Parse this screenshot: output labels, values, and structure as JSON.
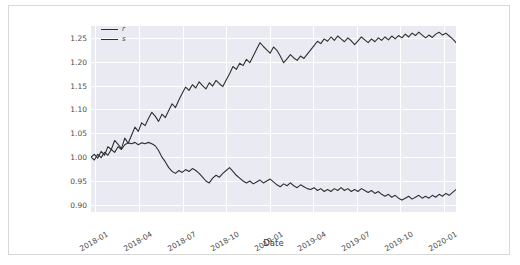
{
  "figure": {
    "background_color": "#ffffff",
    "border_color": "#d8d8d8",
    "plot_background_color": "#eaeaf2",
    "grid_color": "#ffffff",
    "line_color": "#303030"
  },
  "axes": {
    "xlabel": "Date",
    "ylabel": "",
    "ytick_labels": [
      "0.90",
      "0.95",
      "1.00",
      "1.05",
      "1.10",
      "1.15",
      "1.20",
      "1.25"
    ],
    "xtick_labels": [
      "2018-01",
      "2018-04",
      "2018-07",
      "2018-10",
      "2019-01",
      "2019-04",
      "2019-07",
      "2019-10",
      "2020-01"
    ]
  },
  "legend": {
    "entries": [
      {
        "label": "r",
        "color": "#303030"
      },
      {
        "label": "s",
        "color": "#303030"
      }
    ]
  },
  "chart_data": {
    "type": "line",
    "title": "",
    "xlabel": "Date",
    "ylabel": "",
    "grid": true,
    "legend_position": "upper left",
    "xlim": [
      "2018-01-01",
      "2020-02-01"
    ],
    "ylim": [
      0.885,
      1.275
    ],
    "ytick_values": [
      0.9,
      0.95,
      1.0,
      1.05,
      1.1,
      1.15,
      1.2,
      1.25
    ],
    "xtick_values": [
      "2018-01",
      "2018-04",
      "2018-07",
      "2018-10",
      "2019-01",
      "2019-04",
      "2019-07",
      "2019-10",
      "2020-01"
    ],
    "x": [
      "2018-01-02",
      "2018-01-09",
      "2018-01-16",
      "2018-01-23",
      "2018-01-30",
      "2018-02-06",
      "2018-02-13",
      "2018-02-20",
      "2018-02-27",
      "2018-03-06",
      "2018-03-13",
      "2018-03-20",
      "2018-03-27",
      "2018-04-03",
      "2018-04-10",
      "2018-04-17",
      "2018-04-24",
      "2018-05-01",
      "2018-05-08",
      "2018-05-15",
      "2018-05-22",
      "2018-05-29",
      "2018-06-05",
      "2018-06-12",
      "2018-06-19",
      "2018-06-26",
      "2018-07-03",
      "2018-07-10",
      "2018-07-17",
      "2018-07-24",
      "2018-07-31",
      "2018-08-07",
      "2018-08-14",
      "2018-08-21",
      "2018-08-28",
      "2018-09-04",
      "2018-09-11",
      "2018-09-18",
      "2018-09-25",
      "2018-10-02",
      "2018-10-09",
      "2018-10-16",
      "2018-10-23",
      "2018-10-30",
      "2018-11-06",
      "2018-11-13",
      "2018-11-20",
      "2018-11-27",
      "2018-12-04",
      "2018-12-11",
      "2018-12-18",
      "2018-12-25",
      "2019-01-01",
      "2019-01-08",
      "2019-01-15",
      "2019-01-22",
      "2019-01-29",
      "2019-02-05",
      "2019-02-12",
      "2019-02-19",
      "2019-02-26",
      "2019-03-05",
      "2019-03-12",
      "2019-03-19",
      "2019-03-26",
      "2019-04-02",
      "2019-04-09",
      "2019-04-16",
      "2019-04-23",
      "2019-04-30",
      "2019-05-07",
      "2019-05-14",
      "2019-05-21",
      "2019-05-28",
      "2019-06-04",
      "2019-06-11",
      "2019-06-18",
      "2019-06-25",
      "2019-07-02",
      "2019-07-09",
      "2019-07-16",
      "2019-07-23",
      "2019-07-30",
      "2019-08-06",
      "2019-08-13",
      "2019-08-20",
      "2019-08-27",
      "2019-09-03",
      "2019-09-10",
      "2019-09-17",
      "2019-09-24",
      "2019-10-01",
      "2019-10-08",
      "2019-10-15",
      "2019-10-22",
      "2019-10-29",
      "2019-11-05",
      "2019-11-12",
      "2019-11-19",
      "2019-11-26",
      "2019-12-03",
      "2019-12-10",
      "2019-12-17",
      "2019-12-24",
      "2019-12-31",
      "2020-01-07",
      "2020-01-14",
      "2020-01-21",
      "2020-01-28"
    ],
    "series": [
      {
        "name": "r",
        "color": "#303030",
        "values": [
          1.0,
          1.006,
          0.998,
          1.012,
          1.004,
          1.022,
          1.016,
          1.035,
          1.027,
          1.018,
          1.04,
          1.029,
          1.046,
          1.063,
          1.054,
          1.072,
          1.066,
          1.081,
          1.094,
          1.086,
          1.075,
          1.09,
          1.083,
          1.098,
          1.112,
          1.104,
          1.12,
          1.134,
          1.147,
          1.14,
          1.152,
          1.145,
          1.158,
          1.15,
          1.143,
          1.156,
          1.149,
          1.161,
          1.154,
          1.148,
          1.162,
          1.175,
          1.19,
          1.184,
          1.197,
          1.192,
          1.205,
          1.198,
          1.212,
          1.226,
          1.24,
          1.232,
          1.225,
          1.218,
          1.231,
          1.224,
          1.212,
          1.198,
          1.206,
          1.215,
          1.208,
          1.203,
          1.212,
          1.207,
          1.216,
          1.225,
          1.234,
          1.243,
          1.238,
          1.248,
          1.243,
          1.252,
          1.245,
          1.254,
          1.248,
          1.242,
          1.25,
          1.244,
          1.236,
          1.244,
          1.252,
          1.246,
          1.24,
          1.248,
          1.242,
          1.25,
          1.245,
          1.252,
          1.246,
          1.254,
          1.248,
          1.255,
          1.25,
          1.258,
          1.252,
          1.26,
          1.255,
          1.262,
          1.256,
          1.25,
          1.256,
          1.251,
          1.258,
          1.262,
          1.256,
          1.26,
          1.254,
          1.248,
          1.24
        ]
      },
      {
        "name": "s",
        "color": "#303030",
        "values": [
          1.0,
          0.994,
          1.006,
          0.999,
          1.01,
          1.004,
          1.016,
          1.01,
          1.022,
          1.016,
          1.026,
          1.03,
          1.028,
          1.031,
          1.026,
          1.03,
          1.028,
          1.031,
          1.028,
          1.024,
          1.014,
          1.0,
          0.99,
          0.978,
          0.97,
          0.966,
          0.972,
          0.968,
          0.974,
          0.97,
          0.976,
          0.972,
          0.966,
          0.958,
          0.95,
          0.946,
          0.956,
          0.962,
          0.958,
          0.966,
          0.972,
          0.978,
          0.97,
          0.962,
          0.956,
          0.95,
          0.946,
          0.95,
          0.944,
          0.948,
          0.952,
          0.946,
          0.95,
          0.954,
          0.948,
          0.942,
          0.938,
          0.944,
          0.94,
          0.946,
          0.94,
          0.936,
          0.942,
          0.938,
          0.934,
          0.932,
          0.936,
          0.93,
          0.934,
          0.928,
          0.932,
          0.928,
          0.934,
          0.93,
          0.936,
          0.93,
          0.934,
          0.928,
          0.932,
          0.928,
          0.934,
          0.93,
          0.926,
          0.93,
          0.924,
          0.928,
          0.922,
          0.918,
          0.922,
          0.916,
          0.92,
          0.914,
          0.91,
          0.914,
          0.918,
          0.912,
          0.916,
          0.92,
          0.914,
          0.918,
          0.914,
          0.92,
          0.916,
          0.922,
          0.918,
          0.924,
          0.92,
          0.926,
          0.932
        ]
      }
    ]
  }
}
